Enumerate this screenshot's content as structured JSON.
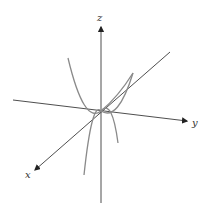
{
  "diagram": {
    "type": "3d-axes-with-parabolas",
    "axes": {
      "x": {
        "label": "x"
      },
      "y": {
        "label": "y"
      },
      "z": {
        "label": "z"
      }
    },
    "colors": {
      "axis": "#3a3a3a",
      "curve": "#8a8a8a",
      "background": "#ffffff"
    }
  }
}
